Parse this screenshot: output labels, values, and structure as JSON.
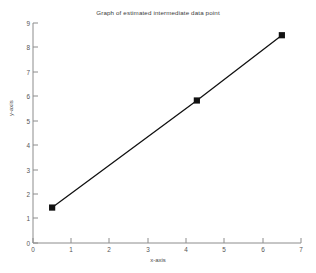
{
  "chart_data": {
    "type": "line",
    "title": "Graph of estimated intermediate data point",
    "xlabel": "x-axis",
    "ylabel": "y-axis",
    "xlim": [
      0,
      7
    ],
    "ylim": [
      0,
      9
    ],
    "xticks": [
      "0",
      "1",
      "2",
      "3",
      "4",
      "5",
      "6",
      "7"
    ],
    "yticks": [
      "0",
      "1",
      "2",
      "3",
      "4",
      "5",
      "6",
      "7",
      "8",
      "9"
    ],
    "grid": false,
    "legend": null,
    "series": [
      {
        "name": "estimated intermediate data point",
        "marker": "filled-square",
        "color": "#111111",
        "x": [
          0.5,
          4.28,
          6.5
        ],
        "y": [
          1.45,
          5.83,
          8.5
        ]
      }
    ]
  },
  "figure": {
    "background": "#ffffff",
    "axis_color": "#8c8c8c",
    "line_color": "#111111"
  }
}
